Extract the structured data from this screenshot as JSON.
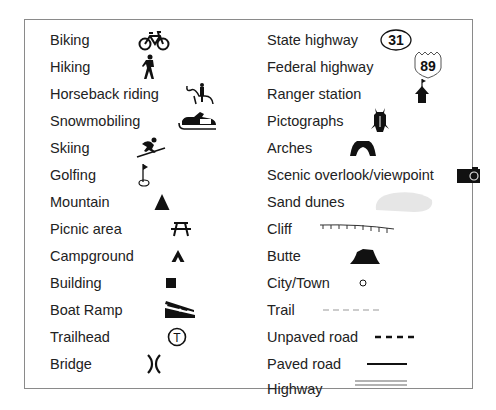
{
  "legend": {
    "left": [
      {
        "label": "Biking",
        "icon": "bicycle-icon"
      },
      {
        "label": "Hiking",
        "icon": "hiker-icon"
      },
      {
        "label": "Horseback riding",
        "icon": "horseback-rider-icon"
      },
      {
        "label": "Snowmobiling",
        "icon": "snowmobile-icon"
      },
      {
        "label": "Skiing",
        "icon": "skier-icon"
      },
      {
        "label": "Golfing",
        "icon": "golf-flag-icon"
      },
      {
        "label": "Mountain",
        "icon": "mountain-triangle-icon"
      },
      {
        "label": "Picnic area",
        "icon": "picnic-table-icon"
      },
      {
        "label": "Campground",
        "icon": "tent-icon"
      },
      {
        "label": "Building",
        "icon": "building-square-icon"
      },
      {
        "label": "Boat Ramp",
        "icon": "boat-ramp-icon"
      },
      {
        "label": "Trailhead",
        "icon": "trailhead-circle-t-icon",
        "icon_text": "T"
      },
      {
        "label": "Bridge",
        "icon": "bridge-icon"
      }
    ],
    "right": [
      {
        "label": "State highway",
        "icon": "state-highway-oval-icon",
        "icon_text": "31"
      },
      {
        "label": "Federal highway",
        "icon": "federal-highway-shield-icon",
        "icon_text": "89"
      },
      {
        "label": "Ranger station",
        "icon": "ranger-station-icon"
      },
      {
        "label": "Pictographs",
        "icon": "pictograph-figure-icon"
      },
      {
        "label": "Arches",
        "icon": "arch-icon"
      },
      {
        "label": "Scenic overlook/viewpoint",
        "icon": "camera-icon"
      },
      {
        "label": "Sand dunes",
        "icon": "sand-dunes-blob-icon"
      },
      {
        "label": "Cliff",
        "icon": "cliff-line-icon"
      },
      {
        "label": "Butte",
        "icon": "butte-icon"
      },
      {
        "label": "City/Town",
        "icon": "city-dot-icon"
      },
      {
        "label": "Trail",
        "icon": "trail-dashed-line-icon"
      },
      {
        "label": "Unpaved road",
        "icon": "unpaved-road-dashed-line-icon"
      },
      {
        "label": "Paved road",
        "icon": "paved-road-line-icon"
      },
      {
        "label": "Highway",
        "icon": "highway-double-line-icon"
      }
    ]
  },
  "colors": {
    "border": "#8a8a8a",
    "symbol": "#111111",
    "sand_dunes_fill": "#e6e6e6",
    "trail_dash": "#999999"
  }
}
